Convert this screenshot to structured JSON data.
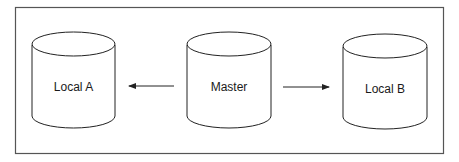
{
  "diagram": {
    "nodes": [
      {
        "id": "local-a",
        "label": "Local A",
        "shape": "cylinder"
      },
      {
        "id": "master",
        "label": "Master",
        "shape": "cylinder"
      },
      {
        "id": "local-b",
        "label": "Local B",
        "shape": "cylinder"
      }
    ],
    "edges": [
      {
        "from": "master",
        "to": "local-a",
        "direction": "left"
      },
      {
        "from": "master",
        "to": "local-b",
        "direction": "right"
      }
    ],
    "colors": {
      "stroke": "#333333",
      "background": "#ffffff"
    }
  }
}
